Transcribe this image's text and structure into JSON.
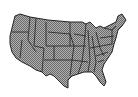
{
  "map": {
    "subject": "Contiguous United States with state borders",
    "fill_color": "#9a9a9a",
    "border_color": "#222222",
    "background": "#ffffff"
  }
}
